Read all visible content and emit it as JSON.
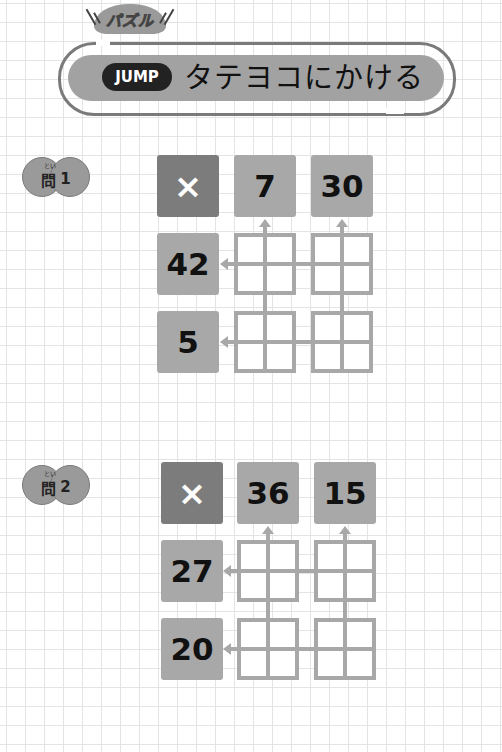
{
  "header": {
    "category_tag": "パズル",
    "level_badge": "JUMP",
    "title": "タテヨコにかける"
  },
  "problems": [
    {
      "label": "問",
      "number": "1",
      "ruby": "とい",
      "operator": "×",
      "column_results": [
        "7",
        "30"
      ],
      "row_results": [
        "42",
        "5"
      ]
    },
    {
      "label": "問",
      "number": "2",
      "ruby": "とい",
      "operator": "×",
      "column_results": [
        "36",
        "15"
      ],
      "row_results": [
        "27",
        "20"
      ]
    }
  ],
  "colors": {
    "tile": "#a8a8a8",
    "operator_tile": "#7c7c7c",
    "banner": "#a2a2a2",
    "badge": "#222222"
  }
}
